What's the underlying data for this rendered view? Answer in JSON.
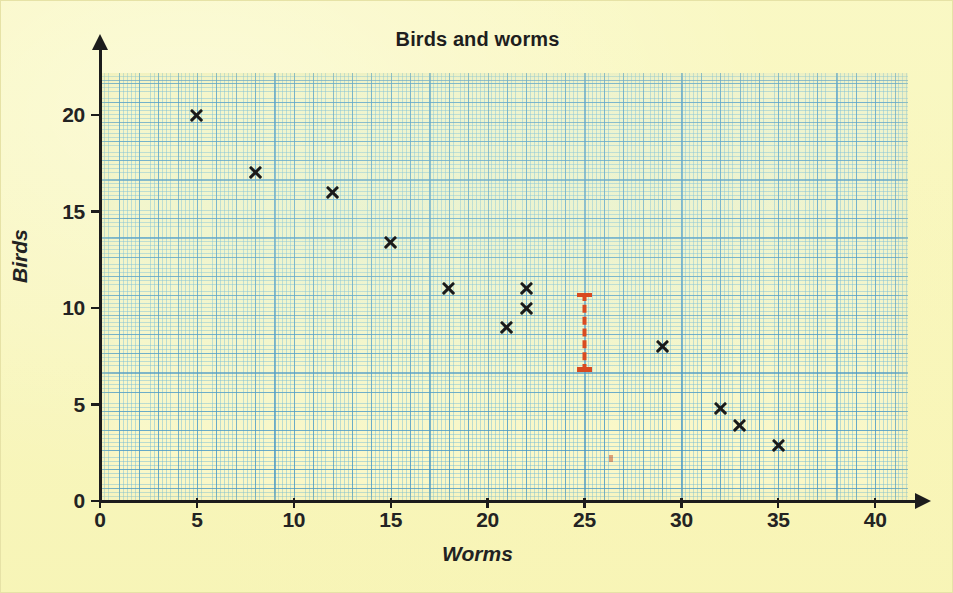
{
  "chart_data": {
    "type": "scatter",
    "title": "Birds and worms",
    "xlabel": "Worms",
    "ylabel": "Birds",
    "xlim": [
      0,
      41.5
    ],
    "ylim": [
      0,
      22.2
    ],
    "grid": "graph-paper",
    "legend": "none",
    "x_ticks": [
      "0",
      "5",
      "10",
      "15",
      "20",
      "25",
      "30",
      "35",
      "40"
    ],
    "x_tick_values": [
      0,
      5,
      10,
      15,
      20,
      25,
      30,
      35,
      40
    ],
    "y_ticks": [
      "0",
      "5",
      "10",
      "15",
      "20"
    ],
    "y_tick_values": [
      0,
      5,
      10,
      15,
      20
    ],
    "marker": "x",
    "marker_color": "#1a1a1a",
    "points": [
      {
        "x": 5,
        "y": 20
      },
      {
        "x": 8,
        "y": 17
      },
      {
        "x": 12,
        "y": 16
      },
      {
        "x": 15,
        "y": 13.4
      },
      {
        "x": 18,
        "y": 11
      },
      {
        "x": 21,
        "y": 9
      },
      {
        "x": 22,
        "y": 11
      },
      {
        "x": 22,
        "y": 10
      },
      {
        "x": 29,
        "y": 8
      },
      {
        "x": 32,
        "y": 4.8
      },
      {
        "x": 33,
        "y": 3.9
      },
      {
        "x": 35,
        "y": 2.9
      }
    ],
    "annotations": [
      {
        "name": "red-interval-marker",
        "type": "vertical-error-bar",
        "x": 25,
        "y_low": 6.7,
        "y_high": 10.8,
        "color": "#D94A20",
        "style": "dashed-with-caps"
      }
    ]
  },
  "figure": {
    "background_color": "#F8F6BA",
    "grid_color": "#4696C3",
    "axis_color": "#1c1c1c"
  }
}
